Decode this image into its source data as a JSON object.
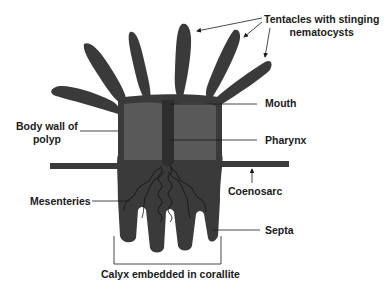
{
  "diagram": {
    "colors": {
      "tentacle": "#3a3a3a",
      "body_inner": "#555555",
      "body_outline": "#3a3a3a",
      "pharynx": "#333333",
      "background": "#ffffff",
      "leader_line": "#1a1a1a"
    },
    "labels": {
      "tentacles_line1": "Tentacles with stinging",
      "tentacles_line2": "nematocysts",
      "mouth": "Mouth",
      "body_wall_line1": "Body wall of",
      "body_wall_line2": "polyp",
      "pharynx": "Pharynx",
      "coenosarc": "Coenosarc",
      "mesenteries": "Mesenteries",
      "septa": "Septa",
      "calyx": "Calyx embedded in corallite"
    }
  }
}
